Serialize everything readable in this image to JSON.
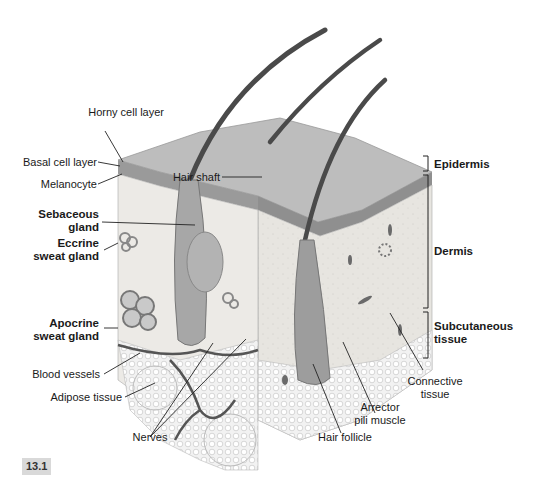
{
  "figure": {
    "number": "13.1"
  },
  "labels_left": {
    "horny_cell_layer": "Horny cell layer",
    "basal_cell_layer": "Basal cell layer",
    "melanocyte": "Melanocyte",
    "sebaceous_gland_1": "Sebaceous",
    "sebaceous_gland_2": "gland",
    "eccrine_1": "Eccrine",
    "eccrine_2": "sweat gland",
    "apocrine_1": "Apocrine",
    "apocrine_2": "sweat gland",
    "blood_vessels": "Blood vessels",
    "adipose_tissue": "Adipose tissue"
  },
  "labels_top": {
    "hair_shaft": "Hair shaft"
  },
  "labels_bottom": {
    "nerves": "Nerves",
    "hair_follicle": "Hair follicle",
    "arrector_1": "Arrector",
    "arrector_2": "pili muscle",
    "connective_1": "Connective",
    "connective_2": "tissue"
  },
  "layers_right": {
    "epidermis": "Epidermis",
    "dermis": "Dermis",
    "subcutaneous_1": "Subcutaneous",
    "subcutaneous_2": "tissue"
  },
  "colors": {
    "epidermis_top": "#b9b9b9",
    "dermis": "#e6e4df",
    "hair": "#4a4a4a",
    "adipose": "#efefef",
    "vessels": "#555555"
  }
}
